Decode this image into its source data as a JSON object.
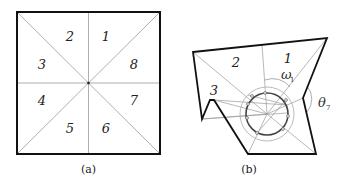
{
  "panel_a": {
    "caption": "(a)",
    "sector_labels": [
      {
        "text": "1",
        "x": 106,
        "y": 41
      },
      {
        "text": "2",
        "x": 70,
        "y": 41
      },
      {
        "text": "3",
        "x": 42,
        "y": 69
      },
      {
        "text": "4",
        "x": 42,
        "y": 105
      },
      {
        "text": "5",
        "x": 70,
        "y": 133
      },
      {
        "text": "6",
        "x": 106,
        "y": 133
      },
      {
        "text": "7",
        "x": 134,
        "y": 105
      },
      {
        "text": "8",
        "x": 134,
        "y": 69
      }
    ]
  },
  "panel_b": {
    "caption": "(b)",
    "region_labels": [
      {
        "text": "1",
        "x": 288,
        "y": 63
      },
      {
        "text": "2",
        "x": 236,
        "y": 67
      },
      {
        "text": "3",
        "x": 214,
        "y": 95
      }
    ],
    "angle_labels": {
      "omega": {
        "symbol": "ω",
        "subscript": "1"
      },
      "theta": {
        "symbol": "θ",
        "subscript": "7"
      }
    }
  },
  "colors": {
    "outline": "#111111",
    "guide": "#9a9a9a",
    "text": "#222222"
  }
}
